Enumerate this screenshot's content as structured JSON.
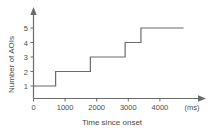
{
  "chart_data": {
    "type": "line",
    "subtype": "step-post",
    "title": "",
    "xlabel": "Time since onset",
    "ylabel": "Number of AOIs",
    "x_unit": "(ms)",
    "xlim": [
      0,
      4800
    ],
    "ylim": [
      0,
      5.6
    ],
    "xticks": [
      0,
      1000,
      2000,
      3000,
      4000
    ],
    "xtick_labels": [
      "0",
      "1000",
      "2000",
      "3000",
      "4000"
    ],
    "yticks": [
      1,
      2,
      3,
      4,
      5
    ],
    "ytick_labels": [
      "1",
      "2",
      "3",
      "4",
      "5"
    ],
    "grid": false,
    "legend": false,
    "x": [
      0,
      700,
      700,
      1800,
      1800,
      2900,
      2900,
      3400,
      3400,
      4750
    ],
    "y": [
      1,
      1,
      2,
      2,
      3,
      3,
      4,
      4,
      5,
      5
    ],
    "steps": [
      {
        "time": 0,
        "count": 1
      },
      {
        "time": 700,
        "count": 2
      },
      {
        "time": 1800,
        "count": 3
      },
      {
        "time": 2900,
        "count": 4
      },
      {
        "time": 3400,
        "count": 5
      }
    ],
    "series": [
      {
        "name": "Number of AOIs",
        "color": "#6b6b6b",
        "values": [
          1,
          1,
          2,
          2,
          3,
          3,
          4,
          4,
          5,
          5
        ]
      }
    ],
    "axis_color": "#6b6b6b",
    "line_color": "#6b6b6b",
    "background": "#ffffff",
    "x_axis_arrow": true,
    "y_axis_arrow": true
  }
}
